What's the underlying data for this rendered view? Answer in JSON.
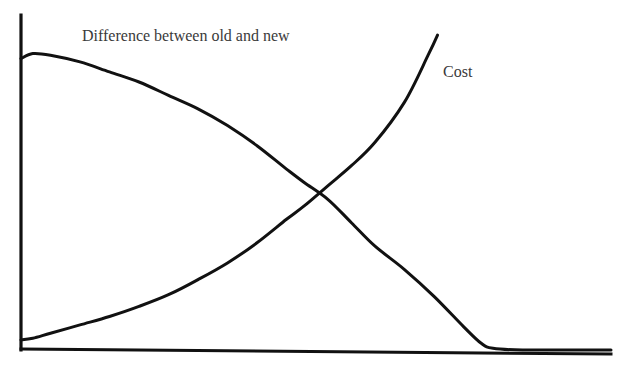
{
  "chart_data": {
    "type": "line",
    "title": "",
    "xlabel": "",
    "ylabel": "",
    "grid": false,
    "legend": "inline labels",
    "xlim": [
      0,
      100
    ],
    "ylim": [
      0,
      100
    ],
    "series": [
      {
        "name": "Difference between old and new",
        "color": "#111111",
        "x": [
          0,
          2,
          5,
          10,
          15,
          20,
          25,
          30,
          35,
          40,
          45,
          48,
          52,
          56,
          60,
          65,
          70,
          75,
          78,
          80,
          85,
          100
        ],
        "values": [
          87,
          88.5,
          88,
          86,
          83,
          80,
          76,
          72,
          67,
          61,
          54,
          50,
          45,
          38,
          31,
          24,
          16,
          7,
          2,
          0.5,
          0,
          0
        ]
      },
      {
        "name": "Cost",
        "color": "#111111",
        "x": [
          0,
          2,
          5,
          10,
          15,
          20,
          25,
          30,
          35,
          40,
          45,
          48,
          52,
          56,
          60,
          65,
          69,
          70.6
        ],
        "values": [
          3,
          3.5,
          5,
          7.5,
          10,
          13,
          16.5,
          21,
          26,
          32,
          39,
          43,
          49,
          55,
          62,
          74,
          88,
          94
        ]
      }
    ],
    "annotations": [
      {
        "text": "Difference between old and new",
        "x": 10.5,
        "y": 92
      },
      {
        "text": "Cost",
        "x": 72,
        "y": 82
      }
    ],
    "crossing_point": {
      "x": 48,
      "y": 43
    }
  },
  "labels": {
    "difference": "Difference between old and new",
    "cost": "Cost"
  },
  "colors": {
    "line": "#111111",
    "axis": "#111111",
    "text": "#3a3a3a",
    "background": "#ffffff"
  }
}
